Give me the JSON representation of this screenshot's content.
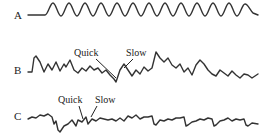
{
  "diagram": {
    "type": "waveform-traces",
    "traces": [
      {
        "id": "A",
        "label": "A",
        "description": "regular sinusoidal wave",
        "annotations": []
      },
      {
        "id": "B",
        "label": "B",
        "description": "irregular wave with quick and slow components",
        "annotations": [
          {
            "text": "Quick"
          },
          {
            "text": "Slow"
          }
        ]
      },
      {
        "id": "C",
        "label": "C",
        "description": "low-amplitude irregular wave with quick and slow components",
        "annotations": [
          {
            "text": "Quick"
          },
          {
            "text": "Slow"
          }
        ]
      }
    ],
    "colors": {
      "line": "#333333",
      "text": "#222222",
      "background": "#ffffff"
    }
  }
}
